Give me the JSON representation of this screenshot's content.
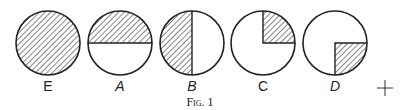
{
  "figure": {
    "caption": "Fig. 1",
    "circles": [
      {
        "label": "E",
        "shaded": "full"
      },
      {
        "label": "A",
        "shaded": "top-half"
      },
      {
        "label": "B",
        "shaded": "left-half"
      },
      {
        "label": "C",
        "shaded": "top-right-quarter"
      },
      {
        "label": "D",
        "shaded": "bottom-right-quarter"
      }
    ],
    "marker": "+"
  }
}
